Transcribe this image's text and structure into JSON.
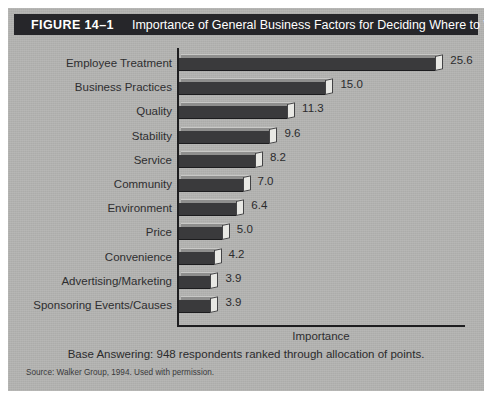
{
  "figure": {
    "number": "FIGURE 14–1",
    "title": "Importance of General Business Factors for Deciding Where to Work"
  },
  "notes": {
    "base": "Base Answering: 948 respondents ranked through allocation of points.",
    "source": "Source: Walker Group, 1994. Used with permission."
  },
  "colors": {
    "panel_background": "#b4b4b2",
    "title_bar": "#26262a",
    "title_text": "#ffffff",
    "bar_body": "#3a3a3c",
    "bar_top_bevel": "#8f8f8e",
    "bar_end_cap": "#e8e8e4",
    "axis": "#1e1e20",
    "label_text": "#2e2e30"
  },
  "chart_data": {
    "type": "bar",
    "orientation": "horizontal",
    "title": "Importance of General Business Factors for Deciding Where to Work",
    "xlabel": "Importance",
    "ylabel": "",
    "xlim": [
      0,
      27.5
    ],
    "grid": false,
    "legend": false,
    "categories": [
      "Employee Treatment",
      "Business Practices",
      "Quality",
      "Stability",
      "Service",
      "Community",
      "Environment",
      "Price",
      "Convenience",
      "Advertising/Marketing",
      "Sponsoring Events/Causes"
    ],
    "values": [
      25.6,
      15.0,
      11.3,
      9.6,
      8.2,
      7.0,
      6.4,
      5.0,
      4.2,
      3.9,
      3.9
    ],
    "value_labels": [
      "25.6",
      "15.0",
      "11.3",
      "9.6",
      "8.2",
      "7.0",
      "6.4",
      "5.0",
      "4.2",
      "3.9",
      "3.9"
    ]
  }
}
